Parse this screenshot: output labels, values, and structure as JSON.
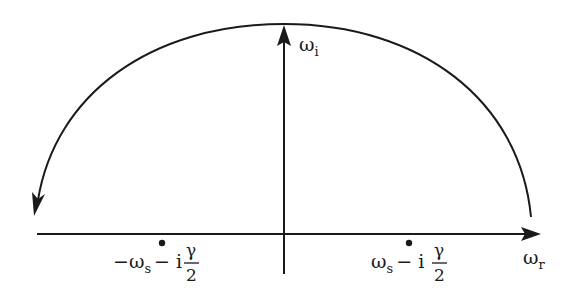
{
  "diagram": {
    "type": "complex-plane contour",
    "axes": {
      "horizontal": {
        "label_main": "ω",
        "label_sub": "r"
      },
      "vertical": {
        "label_main": "ω",
        "label_sub": "i"
      }
    },
    "contour": {
      "shape": "semicircle",
      "direction": "counterclockwise",
      "half_plane": "upper"
    },
    "poles": [
      {
        "name": "left-pole",
        "prefix": "−ω",
        "sub": "s",
        "minus_i": "− i",
        "frac_num": "γ",
        "frac_den": "2"
      },
      {
        "name": "right-pole",
        "prefix": "ω",
        "sub": "s",
        "minus_i": "− i",
        "frac_num": "γ",
        "frac_den": "2"
      }
    ]
  },
  "colors": {
    "stroke": "#1a1a1a",
    "background": "#ffffff"
  }
}
